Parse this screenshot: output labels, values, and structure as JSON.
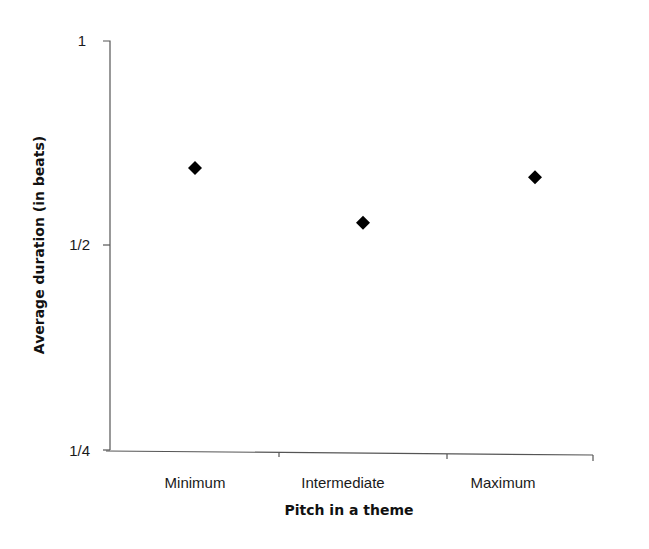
{
  "chart_data": {
    "type": "scatter",
    "title": "",
    "xlabel": "Pitch in a theme",
    "ylabel": "Average duration (in beats)",
    "y_scale": "log2",
    "ylim": [
      0.25,
      1
    ],
    "yticks": [
      {
        "value": 1,
        "label": "1"
      },
      {
        "value": 0.5,
        "label": "1/2"
      },
      {
        "value": 0.25,
        "label": "1/4"
      }
    ],
    "categories": [
      "Minimum",
      "Intermediate",
      "Maximum"
    ],
    "values": [
      0.65,
      0.54,
      0.63
    ],
    "marker": "diamond",
    "marker_color": "#000000",
    "grid": false,
    "legend": null
  }
}
